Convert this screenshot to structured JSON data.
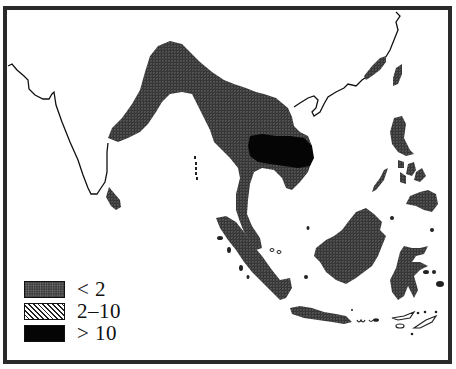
{
  "map": {
    "region": "South and Southeast Asia",
    "colors": {
      "background": "#ffffff",
      "frame": "#2a2a2a",
      "coastline": "#111111",
      "low_fill": "#3a3a3a",
      "high_fill": "#050505"
    }
  },
  "legend": {
    "items": [
      {
        "symbol": "stippled-dark",
        "label": "< 2"
      },
      {
        "symbol": "diagonal-hatch",
        "label": "2–10"
      },
      {
        "symbol": "solid-black",
        "label": "> 10"
      }
    ]
  }
}
